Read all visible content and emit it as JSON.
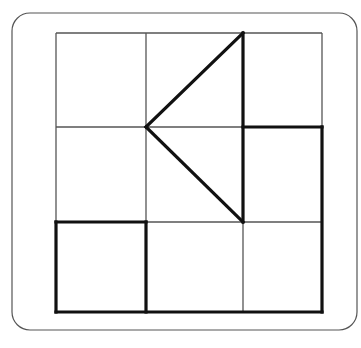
{
  "canvas": {
    "width": 361,
    "height": 348,
    "background": "#ffffff"
  },
  "frame": {
    "label": "rounded-border-frame",
    "x": 12,
    "y": 13,
    "width": 345,
    "height": 317,
    "corner_radius": 18,
    "stroke": "#555555",
    "stroke_width": 1.2
  },
  "grid": {
    "label": "3x3-grid",
    "left": 56,
    "top": 33,
    "right": 322,
    "bottom": 312,
    "columns": 3,
    "rows": 3,
    "x_lines": [
      56,
      146,
      243,
      322
    ],
    "y_lines": [
      33,
      127,
      222,
      312
    ],
    "thin_stroke": "#555555",
    "thin_width": 1.3,
    "thick_stroke": "#111111",
    "thick_width": 3.2
  },
  "shapes": {
    "thin_segments": [
      {
        "name": "grid-top-edge",
        "x1": 56,
        "y1": 33,
        "x2": 322,
        "y2": 33
      },
      {
        "name": "grid-left-edge-upper",
        "x1": 56,
        "y1": 33,
        "x2": 56,
        "y2": 222
      },
      {
        "name": "grid-right-edge-upper",
        "x1": 322,
        "y1": 33,
        "x2": 322,
        "y2": 127
      },
      {
        "name": "vertical-line-1",
        "x1": 146,
        "y1": 33,
        "x2": 146,
        "y2": 222
      },
      {
        "name": "vertical-line-2-lower",
        "x1": 243,
        "y1": 222,
        "x2": 243,
        "y2": 312
      },
      {
        "name": "horizontal-line-1-left",
        "x1": 56,
        "y1": 127,
        "x2": 146,
        "y2": 127
      },
      {
        "name": "horizontal-line-1-middle",
        "x1": 146,
        "y1": 127,
        "x2": 243,
        "y2": 127
      },
      {
        "name": "horizontal-line-2-middle",
        "x1": 146,
        "y1": 222,
        "x2": 322,
        "y2": 222
      }
    ],
    "thick_segments": [
      {
        "name": "triangle-vertical-edge",
        "x1": 243,
        "y1": 33,
        "x2": 243,
        "y2": 222
      },
      {
        "name": "triangle-upper-diagonal",
        "x1": 146,
        "y1": 127,
        "x2": 243,
        "y2": 33
      },
      {
        "name": "triangle-lower-diagonal",
        "x1": 146,
        "y1": 127,
        "x2": 243,
        "y2": 222
      },
      {
        "name": "middle-right-square-top-edge",
        "x1": 243,
        "y1": 127,
        "x2": 322,
        "y2": 127
      },
      {
        "name": "grid-right-edge-lower",
        "x1": 322,
        "y1": 127,
        "x2": 322,
        "y2": 312
      },
      {
        "name": "grid-bottom-edge",
        "x1": 56,
        "y1": 312,
        "x2": 322,
        "y2": 312
      },
      {
        "name": "bottom-left-square-top-edge",
        "x1": 56,
        "y1": 222,
        "x2": 146,
        "y2": 222
      },
      {
        "name": "bottom-left-square-left-edge",
        "x1": 56,
        "y1": 222,
        "x2": 56,
        "y2": 312
      },
      {
        "name": "bottom-left-square-right-edge",
        "x1": 146,
        "y1": 222,
        "x2": 146,
        "y2": 312
      }
    ]
  }
}
